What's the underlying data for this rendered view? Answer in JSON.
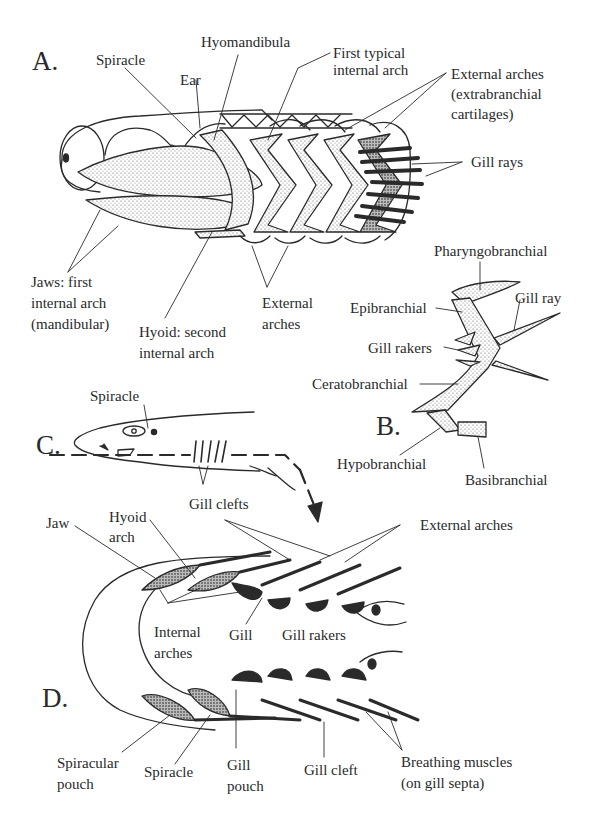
{
  "figure": {
    "colors": {
      "ink": "#2a2a2a",
      "background": "#ffffff",
      "stipple": "#555555"
    }
  },
  "panels": {
    "A": {
      "letter": "A.",
      "labels": {
        "spiracle": "Spiracle",
        "ear": "Ear",
        "hyomandibula": "Hyomandibula",
        "first_typical_1": "First typical",
        "first_typical_2": "internal arch",
        "external_arches_1": "External arches",
        "external_arches_2": "(extrabranchial",
        "external_arches_3": "cartilages)",
        "gill_rays": "Gill rays",
        "jaws_1": "Jaws: first",
        "jaws_2": "internal arch",
        "jaws_3": "(mandibular)",
        "hyoid_1": "Hyoid: second",
        "hyoid_2": "internal arch",
        "external_lower_1": "External",
        "external_lower_2": "arches"
      }
    },
    "B": {
      "letter": "B.",
      "labels": {
        "pharyngobranchial": "Pharyngobranchial",
        "epibranchial": "Epibranchial",
        "gill_ray": "Gill ray",
        "gill_rakers": "Gill rakers",
        "ceratobranchial": "Ceratobranchial",
        "hypobranchial": "Hypobranchial",
        "basibranchial": "Basibranchial"
      }
    },
    "C": {
      "letter": "C.",
      "labels": {
        "spiracle": "Spiracle",
        "gill_clefts": "Gill clefts"
      }
    },
    "D": {
      "letter": "D.",
      "labels": {
        "jaw": "Jaw",
        "hyoid_1": "Hyoid",
        "hyoid_2": "arch",
        "external_arches": "External arches",
        "internal_1": "Internal",
        "internal_2": "arches",
        "gill": "Gill",
        "gill_rakers": "Gill rakers",
        "spiracular_1": "Spiracular",
        "spiracular_2": "pouch",
        "spiracle": "Spiracle",
        "gill_pouch_1": "Gill",
        "gill_pouch_2": "pouch",
        "gill_cleft": "Gill cleft",
        "breathing_1": "Breathing muscles",
        "breathing_2": "(on gill septa)"
      }
    }
  }
}
